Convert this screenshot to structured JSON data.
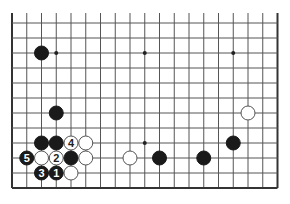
{
  "diagram": {
    "type": "go-board-fragment",
    "board_size": 19,
    "visible_rows": 12,
    "origin": {
      "x": 12,
      "y": 188
    },
    "spacing": {
      "x": 14.75,
      "y": 15
    },
    "top_open": true,
    "colors": {
      "line": "#555555",
      "edge": "#333333",
      "black": "#1a1a1a",
      "white": "#ffffff",
      "white_stroke": "#555555",
      "label_on_black": "#ffffff",
      "label_on_white": "#222222"
    },
    "star_points": [
      {
        "col": 4,
        "row": 10
      },
      {
        "col": 10,
        "row": 10
      },
      {
        "col": 16,
        "row": 10
      },
      {
        "col": 10,
        "row": 4
      }
    ],
    "stones": [
      {
        "color": "black",
        "col": 3,
        "row": 10,
        "label": ""
      },
      {
        "color": "black",
        "col": 4,
        "row": 6,
        "label": ""
      },
      {
        "color": "white",
        "col": 17,
        "row": 6,
        "label": ""
      },
      {
        "color": "black",
        "col": 3,
        "row": 4,
        "label": ""
      },
      {
        "color": "black",
        "col": 4,
        "row": 4,
        "label": ""
      },
      {
        "color": "white",
        "col": 5,
        "row": 4,
        "label": "4"
      },
      {
        "color": "white",
        "col": 6,
        "row": 4,
        "label": ""
      },
      {
        "color": "black",
        "col": 16,
        "row": 4,
        "label": ""
      },
      {
        "color": "black",
        "col": 2,
        "row": 3,
        "label": "5"
      },
      {
        "color": "white",
        "col": 3,
        "row": 3,
        "label": ""
      },
      {
        "color": "white",
        "col": 4,
        "row": 3,
        "label": "2"
      },
      {
        "color": "black",
        "col": 5,
        "row": 3,
        "label": ""
      },
      {
        "color": "white",
        "col": 6,
        "row": 3,
        "label": ""
      },
      {
        "color": "white",
        "col": 9,
        "row": 3,
        "label": ""
      },
      {
        "color": "black",
        "col": 11,
        "row": 3,
        "label": ""
      },
      {
        "color": "black",
        "col": 14,
        "row": 3,
        "label": ""
      },
      {
        "color": "black",
        "col": 3,
        "row": 2,
        "label": "3"
      },
      {
        "color": "black",
        "col": 4,
        "row": 2,
        "label": "1"
      },
      {
        "color": "white",
        "col": 5,
        "row": 2,
        "label": ""
      }
    ]
  }
}
